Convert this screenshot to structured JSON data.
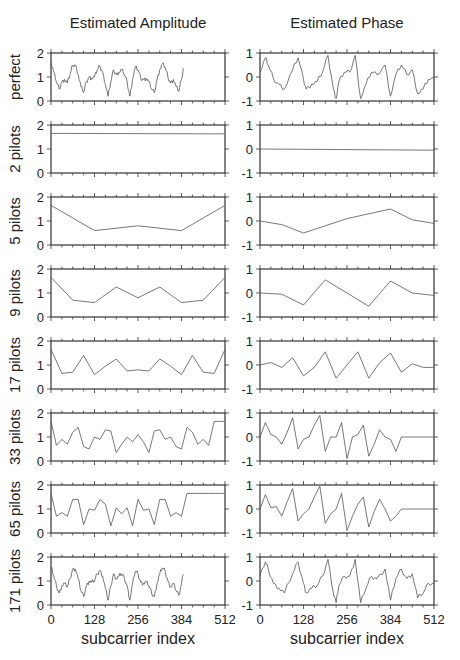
{
  "figure": {
    "left_title": "Estimated Amplitude",
    "right_title": "Estimated Phase",
    "xlabel": "subcarrier index"
  },
  "chart_data": {
    "type": "line",
    "layout": "8 rows x 2 columns small multiples",
    "x_ticks": [
      0,
      128,
      256,
      384,
      512
    ],
    "x_range": [
      0,
      512
    ],
    "xlabel": "subcarrier index",
    "columns": [
      {
        "title": "Estimated Amplitude",
        "ylim": [
          0,
          2
        ],
        "y_ticks": [
          0,
          1,
          2
        ]
      },
      {
        "title": "Estimated Phase",
        "ylim": [
          -1,
          1
        ],
        "y_ticks": [
          -1,
          0,
          1
        ]
      }
    ],
    "rows": [
      {
        "label": "perfect",
        "amplitude": {
          "x": [
            0,
            8,
            16,
            24,
            32,
            40,
            48,
            56,
            64,
            72,
            80,
            88,
            96,
            104,
            112,
            120,
            128,
            136,
            144,
            152,
            160,
            168,
            176,
            184,
            192,
            200,
            208,
            216,
            224,
            232,
            240,
            248,
            256,
            264,
            272,
            280,
            288,
            296,
            304,
            312,
            320,
            328,
            336,
            344,
            352,
            360,
            368,
            376,
            384,
            392,
            400,
            408,
            416,
            424,
            432,
            440,
            448,
            456,
            464,
            472,
            480,
            488,
            496,
            504,
            512
          ],
          "y": [
            1.6,
            1.2,
            0.8,
            0.5,
            0.8,
            0.9,
            0.75,
            1.1,
            1.5,
            1.5,
            1.1,
            0.6,
            0.35,
            0.8,
            1.0,
            0.95,
            1.0,
            1.3,
            1.45,
            1.2,
            0.7,
            0.2,
            0.8,
            1.3,
            1.1,
            1.2,
            1.3,
            1.1,
            0.8,
            0.2,
            0.9,
            1.4,
            1.3,
            0.95,
            0.9,
            0.95,
            0.8,
            0.5,
            0.35,
            0.9,
            1.3,
            1.55,
            1.4,
            1.0,
            0.75,
            0.9,
            0.6,
            0.4,
            0.9,
            1.6
          ]
        },
        "phase": {
          "x": [
            0,
            16,
            24,
            40,
            56,
            72,
            96,
            112,
            128,
            136,
            152,
            168,
            184,
            200,
            216,
            224,
            232,
            248,
            264,
            280,
            296,
            312,
            328,
            344,
            368,
            384,
            400,
            416,
            432,
            448,
            464,
            480,
            496,
            512
          ],
          "y": [
            0.2,
            0.8,
            0.5,
            -0.1,
            -0.3,
            -0.5,
            0.3,
            0.8,
            -0.1,
            -0.5,
            -0.3,
            -0.2,
            0.2,
            0.9,
            -0.5,
            -0.9,
            -0.2,
            0.2,
            0.2,
            0.9,
            -0.9,
            -0.3,
            0.2,
            0.1,
            0.5,
            -0.8,
            0.1,
            0.5,
            0.1,
            0.3,
            -0.7,
            -0.5,
            -0.1,
            -0.1
          ]
        }
      },
      {
        "label": "2 pilots",
        "amplitude": {
          "x": [
            0,
            512
          ],
          "y": [
            1.65,
            1.63
          ]
        },
        "phase": {
          "x": [
            0,
            512
          ],
          "y": [
            0.0,
            -0.05
          ]
        }
      },
      {
        "label": "5 pilots",
        "amplitude": {
          "x": [
            0,
            128,
            256,
            384,
            512
          ],
          "y": [
            1.65,
            0.6,
            0.8,
            0.6,
            1.65
          ]
        },
        "phase": {
          "x": [
            0,
            64,
            128,
            256,
            384,
            448,
            512
          ],
          "y": [
            0.0,
            -0.15,
            -0.5,
            0.1,
            0.5,
            0.05,
            -0.1
          ]
        }
      },
      {
        "label": "9 pilots",
        "amplitude": {
          "x": [
            0,
            64,
            128,
            192,
            256,
            320,
            384,
            448,
            512
          ],
          "y": [
            1.65,
            0.7,
            0.6,
            1.25,
            0.8,
            1.25,
            0.6,
            0.7,
            1.65
          ]
        },
        "phase": {
          "x": [
            0,
            64,
            128,
            192,
            256,
            320,
            384,
            448,
            512
          ],
          "y": [
            0.0,
            -0.05,
            -0.5,
            0.55,
            -0.0,
            -0.55,
            0.5,
            0.0,
            -0.1
          ]
        }
      },
      {
        "label": "17 pilots",
        "amplitude": {
          "x": [
            0,
            32,
            64,
            96,
            128,
            160,
            192,
            224,
            256,
            288,
            320,
            352,
            384,
            416,
            448,
            480,
            512
          ],
          "y": [
            1.65,
            0.65,
            0.7,
            1.4,
            0.6,
            0.95,
            1.25,
            0.75,
            0.8,
            0.75,
            1.25,
            0.95,
            0.6,
            1.4,
            0.7,
            0.65,
            1.65
          ]
        },
        "phase": {
          "x": [
            0,
            32,
            64,
            96,
            128,
            160,
            192,
            224,
            256,
            288,
            320,
            352,
            384,
            416,
            448,
            480,
            512
          ],
          "y": [
            0.0,
            0.1,
            -0.1,
            0.3,
            -0.45,
            -0.1,
            0.55,
            -0.55,
            0.0,
            0.55,
            -0.55,
            0.1,
            0.5,
            -0.3,
            0.05,
            -0.1,
            -0.1
          ]
        }
      },
      {
        "label": "33 pilots",
        "amplitude": {
          "x": [
            0,
            16,
            32,
            48,
            64,
            80,
            96,
            112,
            128,
            144,
            160,
            176,
            192,
            208,
            224,
            240,
            256,
            272,
            288,
            304,
            320,
            336,
            352,
            368,
            384,
            400,
            416,
            432,
            448,
            464,
            480,
            496,
            512
          ],
          "y": [
            1.65,
            0.65,
            0.9,
            0.7,
            1.2,
            1.4,
            0.6,
            0.5,
            1.0,
            0.9,
            1.3,
            1.25,
            0.35,
            0.7,
            1.0,
            0.8,
            1.1,
            0.8,
            0.35,
            1.25,
            1.3,
            0.9,
            1.0,
            0.6,
            0.5,
            1.4,
            1.2,
            0.7,
            0.9,
            0.65,
            1.65,
            1.65,
            1.65
          ]
        },
        "phase": {
          "x": [
            0,
            16,
            32,
            48,
            64,
            80,
            96,
            112,
            128,
            144,
            160,
            176,
            192,
            208,
            224,
            240,
            256,
            272,
            288,
            304,
            320,
            336,
            352,
            368,
            384,
            400,
            416,
            432,
            448,
            464,
            480,
            496,
            512
          ],
          "y": [
            0.0,
            0.6,
            0.1,
            0.0,
            -0.3,
            0.2,
            0.8,
            -0.5,
            -0.1,
            0.0,
            0.5,
            0.9,
            -0.6,
            0.0,
            0.0,
            0.6,
            -0.9,
            0.0,
            0.1,
            0.5,
            -0.8,
            -0.3,
            0.3,
            0.0,
            -0.1,
            -0.6,
            0.0,
            0.0,
            0.0,
            0.0,
            0.0,
            0.0,
            0.0
          ]
        }
      },
      {
        "label": "65 pilots",
        "amplitude": {
          "x": [
            0,
            16,
            32,
            48,
            64,
            80,
            96,
            112,
            128,
            144,
            160,
            176,
            192,
            208,
            224,
            240,
            256,
            272,
            288,
            304,
            320,
            336,
            352,
            368,
            384,
            400,
            416,
            432,
            448,
            464,
            480,
            496,
            512
          ],
          "y": [
            1.65,
            0.7,
            0.85,
            0.7,
            1.4,
            1.4,
            0.35,
            1.0,
            0.95,
            1.4,
            1.2,
            0.3,
            1.05,
            0.8,
            1.05,
            0.3,
            1.4,
            0.95,
            1.0,
            0.35,
            1.4,
            1.4,
            0.7,
            0.85,
            0.7,
            1.65,
            1.65,
            1.65,
            1.65,
            1.65,
            1.65,
            1.65,
            1.65
          ]
        },
        "phase": {
          "x": [
            0,
            16,
            32,
            48,
            64,
            80,
            96,
            112,
            128,
            144,
            160,
            176,
            192,
            208,
            224,
            240,
            256,
            272,
            288,
            304,
            320,
            336,
            352,
            368,
            384,
            400,
            416,
            432,
            448,
            464,
            480,
            496,
            512
          ],
          "y": [
            0.0,
            0.6,
            0.05,
            0.1,
            -0.3,
            0.3,
            0.85,
            -0.5,
            -0.2,
            0.0,
            0.5,
            0.95,
            -0.6,
            -0.2,
            0.0,
            0.65,
            -0.9,
            -0.3,
            0.2,
            0.5,
            -0.75,
            -0.1,
            0.4,
            0.0,
            -0.5,
            -0.3,
            0.0,
            0.0,
            0.0,
            0.0,
            0.0,
            0.0,
            0.0
          ]
        }
      },
      {
        "label": "171 pilots",
        "amplitude": {
          "note": "nearly identical to perfect estimate"
        },
        "phase": {
          "note": "nearly identical to perfect estimate"
        }
      }
    ]
  }
}
